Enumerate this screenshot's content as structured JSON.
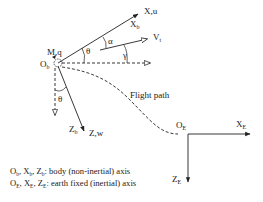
{
  "diagram": {
    "type": "aircraft-axes-diagram",
    "body_frame": {
      "origin": {
        "main": "O",
        "sub": "b"
      },
      "moment": "M,q",
      "x_axis": {
        "main": "X",
        "sub": "b",
        "tip": "X,u"
      },
      "z_axis": {
        "main": "Z",
        "sub": "b",
        "tip": "Z,w"
      },
      "velocity": {
        "main": "V",
        "sub": "t"
      },
      "angles": {
        "theta_upper": "θ",
        "alpha": "α",
        "gamma": "γ",
        "theta_lower": "θ"
      }
    },
    "earth_frame": {
      "origin": {
        "main": "O",
        "sub": "E"
      },
      "x_axis": {
        "main": "X",
        "sub": "E"
      },
      "z_axis": {
        "main": "Z",
        "sub": "E"
      }
    },
    "flight_path_label": "Flight path",
    "legend": [
      {
        "items": [
          {
            "main": "O",
            "sub": "b"
          },
          {
            "main": "X",
            "sub": "b"
          },
          {
            "main": "Z",
            "sub": "b"
          }
        ],
        "text": ": body (non-inertial) axis"
      },
      {
        "items": [
          {
            "main": "O",
            "sub": "E"
          },
          {
            "main": "X",
            "sub": "E"
          },
          {
            "main": "Z",
            "sub": "E"
          }
        ],
        "text": ": earth fixed (inertial) axis"
      }
    ],
    "colors": {
      "line": "#222222",
      "background": "#ffffff"
    }
  }
}
